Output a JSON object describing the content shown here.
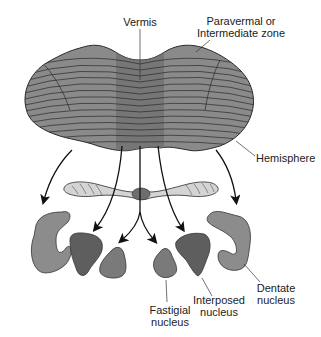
{
  "diagram": {
    "colors": {
      "cortex_fill": "#8a8a8a",
      "vermis_band": "#6e6e6e",
      "folia_line": "#2a2a2a",
      "dentate_fill": "#8c8c8c",
      "interposed_fill": "#5e5e5e",
      "fastigial_fill": "#7a7a7a",
      "ventricle_fill": "#d4d4d4",
      "arrow": "#111111",
      "text": "#222222"
    },
    "labels": {
      "vermis": "Vermis",
      "paravermal_line1": "Paravermal or",
      "paravermal_line2": "Intermediate zone",
      "hemisphere": "Hemisphere",
      "dentate_line1": "Dentate",
      "dentate_line2": "nucleus",
      "interposed_line1": "Interposed",
      "interposed_line2": "nucleus",
      "fastigial_line1": "Fastigial",
      "fastigial_line2": "nucleus"
    },
    "projections": [
      {
        "from": "Hemisphere",
        "to": "Dentate nucleus"
      },
      {
        "from": "Paravermal or Intermediate zone",
        "to": "Interposed nucleus"
      },
      {
        "from": "Vermis",
        "to": "Fastigial nucleus"
      }
    ]
  }
}
